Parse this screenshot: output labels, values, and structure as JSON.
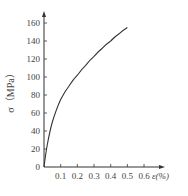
{
  "chart_data": {
    "type": "line",
    "title": "",
    "xlabel": "ε(%)",
    "ylabel": "σ（MPa）",
    "x_ticks": [
      "0.1",
      "0.2",
      "0.3",
      "0.4",
      "0.5",
      "0.6"
    ],
    "y_ticks": [
      "0",
      "20",
      "40",
      "60",
      "80",
      "100",
      "120",
      "140",
      "160"
    ],
    "xlim": [
      0,
      0.65
    ],
    "ylim": [
      0,
      170
    ],
    "grid": false,
    "legend": null,
    "series": [
      {
        "name": "stress-strain",
        "x": [
          0,
          0.02,
          0.05,
          0.1,
          0.15,
          0.2,
          0.25,
          0.3,
          0.35,
          0.4,
          0.45,
          0.5
        ],
        "y": [
          0,
          25,
          50,
          75,
          90,
          102,
          113,
          123,
          132,
          140,
          148,
          155
        ]
      }
    ]
  },
  "axes": {
    "xlabel": "ε(%)",
    "ylabel": "σ（MPa）",
    "origin_label": "0"
  }
}
